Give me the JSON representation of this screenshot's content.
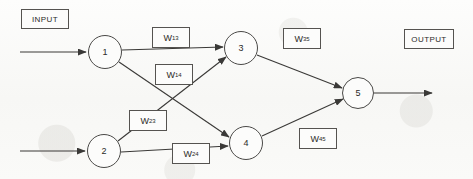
{
  "diagram": {
    "background_color": "#fbfbfa",
    "stroke_color": "#3a3937",
    "annotations": {
      "input_label": "INPUT",
      "output_label": "OUTPUT"
    },
    "nodes": [
      {
        "id": "1",
        "label": "1",
        "cx": 105,
        "cy": 52,
        "r": 17,
        "layer": "input"
      },
      {
        "id": "2",
        "label": "2",
        "cx": 104,
        "cy": 151,
        "r": 17,
        "layer": "input"
      },
      {
        "id": "3",
        "label": "3",
        "cx": 241,
        "cy": 48,
        "r": 17,
        "layer": "hidden"
      },
      {
        "id": "4",
        "label": "4",
        "cx": 246,
        "cy": 143,
        "r": 17,
        "layer": "hidden"
      },
      {
        "id": "5",
        "label": "5",
        "cx": 358,
        "cy": 93,
        "r": 16,
        "layer": "output"
      }
    ],
    "weights": [
      {
        "id": "w13",
        "symbol": "W",
        "subscript": "13",
        "from": "1",
        "to": "3",
        "x": 152,
        "y": 27,
        "w": 38,
        "h": 21
      },
      {
        "id": "w14",
        "symbol": "W",
        "subscript": "14",
        "from": "1",
        "to": "4",
        "x": 155,
        "y": 64,
        "w": 38,
        "h": 21
      },
      {
        "id": "w23",
        "symbol": "W",
        "subscript": "23",
        "from": "2",
        "to": "3",
        "x": 129,
        "y": 110,
        "w": 38,
        "h": 21
      },
      {
        "id": "w24",
        "symbol": "W",
        "subscript": "24",
        "from": "2",
        "to": "4",
        "x": 172,
        "y": 143,
        "w": 38,
        "h": 21
      },
      {
        "id": "w35",
        "symbol": "W",
        "subscript": "35",
        "from": "3",
        "to": "5",
        "x": 283,
        "y": 28,
        "w": 38,
        "h": 21
      },
      {
        "id": "w45",
        "symbol": "W",
        "subscript": "45",
        "from": "4",
        "to": "5",
        "x": 299,
        "y": 128,
        "w": 38,
        "h": 21
      }
    ],
    "io_boxes": [
      {
        "id": "input-box",
        "x": 21,
        "y": 9,
        "w": 48,
        "h": 20
      },
      {
        "id": "output-box",
        "x": 404,
        "y": 29,
        "w": 50,
        "h": 20
      }
    ],
    "input_arrows": [
      {
        "id": "input-arrow-1",
        "x1": 20,
        "y1": 52,
        "x2": 86,
        "y2": 52
      },
      {
        "id": "input-arrow-2",
        "x1": 20,
        "y1": 151,
        "x2": 85,
        "y2": 151
      }
    ],
    "output_arrow": {
      "id": "output-arrow",
      "x1": 374,
      "y1": 93,
      "x2": 432,
      "y2": 93
    },
    "connections": [
      {
        "id": "edge-1-3",
        "from": "1",
        "to": "3",
        "x1": 122,
        "y1": 50,
        "x2": 223,
        "y2": 47
      },
      {
        "id": "edge-1-4",
        "from": "1",
        "to": "4",
        "x1": 119,
        "y1": 62,
        "x2": 229,
        "y2": 137
      },
      {
        "id": "edge-2-3",
        "from": "2",
        "to": "3",
        "x1": 118,
        "y1": 141,
        "x2": 226,
        "y2": 57
      },
      {
        "id": "edge-2-4",
        "from": "2",
        "to": "4",
        "x1": 121,
        "y1": 152,
        "x2": 228,
        "y2": 146
      },
      {
        "id": "edge-3-5",
        "from": "3",
        "to": "5",
        "x1": 257,
        "y1": 55,
        "x2": 342,
        "y2": 88
      },
      {
        "id": "edge-4-5",
        "from": "4",
        "to": "5",
        "x1": 262,
        "y1": 136,
        "x2": 343,
        "y2": 99
      }
    ]
  }
}
